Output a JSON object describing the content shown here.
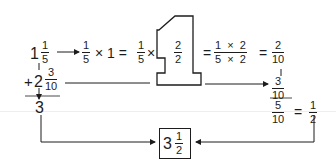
{
  "diagram": {
    "topic": "Adding mixed numbers 1 1/5 + 2 3/10 by finding a common denominator",
    "row1": {
      "mixed_whole": "1",
      "mixed_frac": {
        "num": "1",
        "den": "5"
      },
      "step_frac": {
        "num": "1",
        "den": "5"
      },
      "times_one": "× 1 =",
      "step2_frac": {
        "num": "1",
        "den": "5"
      },
      "times": "×",
      "one_shape_label": "1",
      "inner_frac": {
        "num": "2",
        "den": "2"
      },
      "eq1": "=",
      "product_frac": {
        "num": "1  ×  2",
        "den": "5  ×  2"
      },
      "eq2": "=",
      "result_frac": {
        "num": "2",
        "den": "10"
      }
    },
    "row2": {
      "plus_sign": "+",
      "mixed_whole": "2",
      "mixed_frac": {
        "num": "3",
        "den": "10"
      },
      "carried_frac": {
        "num": "3",
        "den": "10"
      }
    },
    "sums": {
      "whole_sum": "3",
      "frac_sum": {
        "num": "5",
        "den": "10"
      },
      "eq": "=",
      "simplified": {
        "num": "1",
        "den": "2"
      }
    },
    "answer": {
      "whole": "3",
      "frac": {
        "num": "1",
        "den": "2"
      }
    },
    "colors": {
      "ink": "#1c1c1c",
      "background": "#ffffff"
    }
  }
}
